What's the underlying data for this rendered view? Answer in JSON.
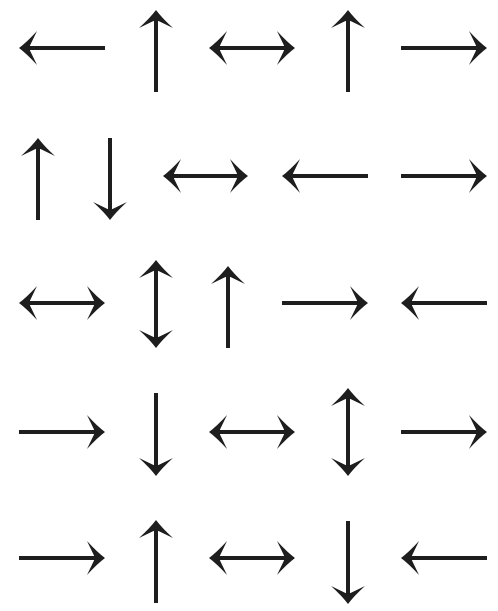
{
  "page": {
    "ink_color": "#1e1e1e",
    "background_color": "#ffffff"
  },
  "rows": [
    {
      "arrows": [
        {
          "dir": "left",
          "x1": 19,
          "y1": 48,
          "x2": 105,
          "y2": 48
        },
        {
          "dir": "up",
          "x1": 156,
          "y1": 10,
          "x2": 156,
          "y2": 92
        },
        {
          "dir": "left-right",
          "x1": 209,
          "y1": 48,
          "x2": 295,
          "y2": 48
        },
        {
          "dir": "up",
          "x1": 348,
          "y1": 10,
          "x2": 348,
          "y2": 92
        },
        {
          "dir": "right",
          "x1": 401,
          "y1": 48,
          "x2": 487,
          "y2": 48
        }
      ]
    },
    {
      "arrows": [
        {
          "dir": "up",
          "x1": 38,
          "y1": 138,
          "x2": 38,
          "y2": 220
        },
        {
          "dir": "down",
          "x1": 110,
          "y1": 138,
          "x2": 110,
          "y2": 220
        },
        {
          "dir": "left-right",
          "x1": 163,
          "y1": 176,
          "x2": 248,
          "y2": 176
        },
        {
          "dir": "left",
          "x1": 282,
          "y1": 176,
          "x2": 368,
          "y2": 176
        },
        {
          "dir": "right",
          "x1": 401,
          "y1": 176,
          "x2": 487,
          "y2": 176
        }
      ]
    },
    {
      "arrows": [
        {
          "dir": "left-right",
          "x1": 19,
          "y1": 303,
          "x2": 105,
          "y2": 303
        },
        {
          "dir": "up-down",
          "x1": 156,
          "y1": 260,
          "x2": 156,
          "y2": 348
        },
        {
          "dir": "up",
          "x1": 228,
          "y1": 266,
          "x2": 228,
          "y2": 348
        },
        {
          "dir": "right",
          "x1": 282,
          "y1": 303,
          "x2": 368,
          "y2": 303
        },
        {
          "dir": "left",
          "x1": 401,
          "y1": 303,
          "x2": 487,
          "y2": 303
        }
      ]
    },
    {
      "arrows": [
        {
          "dir": "right",
          "x1": 19,
          "y1": 432,
          "x2": 105,
          "y2": 432
        },
        {
          "dir": "down",
          "x1": 156,
          "y1": 393,
          "x2": 156,
          "y2": 476
        },
        {
          "dir": "left-right",
          "x1": 209,
          "y1": 432,
          "x2": 295,
          "y2": 432
        },
        {
          "dir": "up-down",
          "x1": 348,
          "y1": 388,
          "x2": 348,
          "y2": 476
        },
        {
          "dir": "right",
          "x1": 401,
          "y1": 432,
          "x2": 487,
          "y2": 432
        }
      ]
    },
    {
      "arrows": [
        {
          "dir": "right",
          "x1": 19,
          "y1": 558,
          "x2": 105,
          "y2": 558
        },
        {
          "dir": "up",
          "x1": 156,
          "y1": 520,
          "x2": 156,
          "y2": 603
        },
        {
          "dir": "left-right",
          "x1": 209,
          "y1": 558,
          "x2": 295,
          "y2": 558
        },
        {
          "dir": "down",
          "x1": 348,
          "y1": 521,
          "x2": 348,
          "y2": 604
        },
        {
          "dir": "left",
          "x1": 401,
          "y1": 558,
          "x2": 487,
          "y2": 558
        }
      ]
    }
  ]
}
